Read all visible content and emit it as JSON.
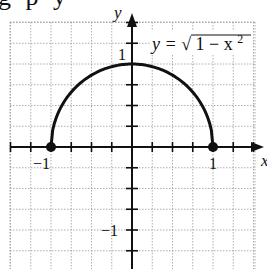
{
  "header_fragment": "g p          y",
  "chart_data": {
    "type": "line",
    "title": "",
    "function_label": "y = √(1 − x²)",
    "xlabel": "x",
    "ylabel": "y",
    "xlim": [
      -1.5,
      1.5
    ],
    "ylim": [
      -1.5,
      1.0
    ],
    "grid": true,
    "grid_step": 0.25,
    "tick_labels": {
      "x": [
        "-1",
        "1"
      ],
      "y": [
        "1",
        "-1"
      ]
    },
    "series": [
      {
        "name": "y = sqrt(1 - x^2)",
        "x": [
          -1,
          -0.75,
          -0.5,
          -0.25,
          0,
          0.25,
          0.5,
          0.75,
          1
        ],
        "y": [
          0,
          0.661,
          0.866,
          0.968,
          1,
          0.968,
          0.866,
          0.661,
          0
        ]
      }
    ],
    "endpoints": [
      {
        "x": -1,
        "y": 0,
        "style": "closed"
      },
      {
        "x": 1,
        "y": 0,
        "style": "closed"
      }
    ]
  },
  "labels": {
    "y_axis": "y",
    "x_axis": "x",
    "x_neg1": "−1",
    "x_pos1": "1",
    "y_pos1": "1",
    "y_neg1": "−1",
    "eq_lhs": "y = ",
    "eq_sqrt": "√",
    "eq_body": "1 − x",
    "eq_exp": "2"
  },
  "colors": {
    "curve": "#111111",
    "grid": "#9a9a9a",
    "axis": "#111111"
  }
}
